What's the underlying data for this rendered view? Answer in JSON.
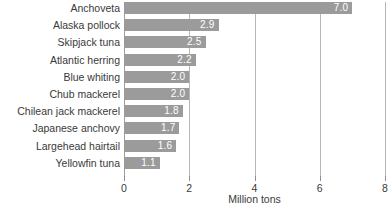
{
  "chart_data": {
    "type": "bar",
    "orientation": "horizontal",
    "title": "",
    "xlabel": "Million tons",
    "ylabel": "",
    "xlim": [
      0,
      8
    ],
    "xticks": [
      "0",
      "2",
      "4",
      "6",
      "8"
    ],
    "grid": "vertical",
    "legend": "none",
    "bar_color": "#9b9b9b",
    "value_label_color": "#ffffff",
    "categories": [
      "Anchoveta",
      "Alaska pollock",
      "Skipjack tuna",
      "Atlantic herring",
      "Blue whiting",
      "Chub mackerel",
      "Chilean jack mackerel",
      "Japanese anchovy",
      "Largehead hairtail",
      "Yellowfin tuna"
    ],
    "values": [
      7.0,
      2.9,
      2.5,
      2.2,
      2.0,
      2.0,
      1.8,
      1.7,
      1.6,
      1.1
    ],
    "value_labels": [
      "7.0",
      "2.9",
      "2.5",
      "2.2",
      "2.0",
      "2.0",
      "1.8",
      "1.7",
      "1.6",
      "1.1"
    ]
  }
}
